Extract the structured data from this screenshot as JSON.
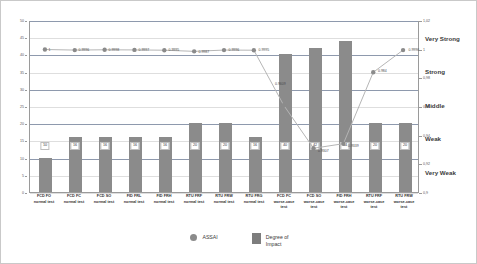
{
  "chart_data": {
    "type": "bar",
    "title": "",
    "xlabel": "",
    "ylabel": "",
    "ylim": [
      0,
      50
    ],
    "y2lim": [
      0.9,
      1.02
    ],
    "grid": true,
    "legend_position": "bottom",
    "categories": [
      "FCD FO\nnormal test",
      "FCD FC\nnormal test",
      "FCD SO\nnormal test",
      "FID FRL\nnormal test",
      "FID FRH\nnormal test",
      "RTU FRF\nnormal test",
      "RTU FRW\nnormal test",
      "RTU FRG\nnormal test",
      "FCD FC\nworse-case\ntest",
      "FCD SO\nworse-case\ntest",
      "FID FRH\nworse-case\ntest",
      "RTU FRF\nworse-case\ntest",
      "RTU FRW\nworse-case\ntest"
    ],
    "series": [
      {
        "name": "Degree of Impact",
        "type": "bar",
        "axis": "left",
        "color": "#8b8b8b",
        "values": [
          10,
          16,
          16,
          16,
          16,
          20,
          20,
          16,
          40,
          42,
          44,
          20,
          20
        ],
        "labels": [
          "10",
          "16",
          "16",
          "16",
          "16",
          "20",
          "20",
          "16",
          "40",
          "42",
          "44",
          "20",
          "20"
        ]
      },
      {
        "name": "ASSAI",
        "type": "line",
        "axis": "right",
        "color": "#8b8b8b",
        "values": [
          1,
          0.9996,
          0.9998,
          0.9997,
          0.9995,
          0.9987,
          0.9996,
          0.9995,
          0.9609,
          0.9307,
          0.9339,
          0.984,
          0.9996
        ],
        "labels": [
          "1",
          "0.9996",
          "0.9998",
          "0.9997",
          "0.9995",
          "0.9987",
          "0.9996",
          "0.9995",
          "0.9609",
          "0.9307",
          "0.9339",
          "0.984",
          "0.9996"
        ]
      }
    ],
    "y_left_ticks": [
      "0",
      "5",
      "10",
      "15",
      "20",
      "25",
      "30",
      "35",
      "40",
      "45",
      "50"
    ],
    "y_right_ticks": [
      "0,9",
      "0,92",
      "0,94",
      "0,96",
      "0,98",
      "1",
      "1,02"
    ],
    "y_right_bands": [
      {
        "label": "Very Weak",
        "value": 0.915
      },
      {
        "label": "Weak",
        "value": 0.9385
      },
      {
        "label": "Middle",
        "value": 0.9615
      },
      {
        "label": "Strong",
        "value": 0.985
      },
      {
        "label": "Very Strong",
        "value": 1.008
      }
    ],
    "legend": [
      {
        "label": "ASSAI",
        "marker": "circle",
        "color": "#8b8b8b"
      },
      {
        "label": "Degree of\nImpact",
        "marker": "bar",
        "color": "#7d7d7d"
      }
    ]
  }
}
